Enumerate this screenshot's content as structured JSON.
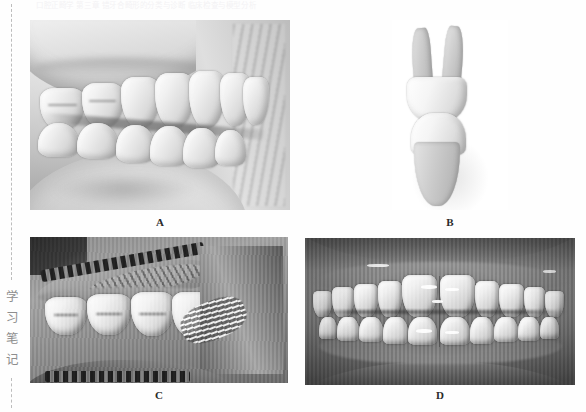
{
  "page": {
    "ghost_header_text": "口腔正畸学  第三章  错牙合畸形的分类与诊断  临床检查与模型分析",
    "side_caption_chars": [
      "学",
      "习",
      "笔",
      "记"
    ],
    "background_color": "#fefefe",
    "rule_color": "#bdbdbd",
    "label_color": "#2a2a2a"
  },
  "figure": {
    "panels": [
      {
        "id": "A",
        "label": "A",
        "caption_position": "below",
        "description": "lateral right buccal view of dental casts in occlusion, stone model, grayscale",
        "tone": "light-gray"
      },
      {
        "id": "B",
        "label": "B",
        "caption_position": "below",
        "description": "isolated single upper and lower tooth pair shown in occlusal contact on white background",
        "tone": "white-background"
      },
      {
        "id": "C",
        "label": "C",
        "caption_position": "below",
        "description": "intraoral lateral photograph with cheek retractor showing buccal segment and palatal rugae",
        "tone": "mid-gray"
      },
      {
        "id": "D",
        "label": "D",
        "caption_position": "below",
        "description": "intraoral frontal photograph of anterior teeth in centric occlusion",
        "tone": "dark-gray"
      }
    ]
  }
}
